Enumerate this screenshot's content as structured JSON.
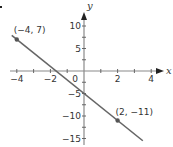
{
  "chart_data": {
    "type": "line",
    "title": "",
    "xlabel": "x",
    "ylabel": "y",
    "xlim": [
      -4.4,
      4.6
    ],
    "ylim": [
      -16,
      12
    ],
    "x_ticks": [
      -4,
      -3,
      -2,
      -1,
      0,
      1,
      2,
      3,
      4
    ],
    "x_tick_labels": [
      {
        "value": -4,
        "label": "−4"
      },
      {
        "value": -2,
        "label": "−2"
      },
      {
        "value": 0,
        "label": "0"
      },
      {
        "value": 2,
        "label": "2"
      },
      {
        "value": 4,
        "label": "4"
      }
    ],
    "y_ticks": [
      -15,
      -12.5,
      -10,
      -7.5,
      -5,
      -2.5,
      2.5,
      5,
      7.5,
      10
    ],
    "y_tick_labels": [
      {
        "value": 10,
        "label": "10"
      },
      {
        "value": 5,
        "label": "5"
      },
      {
        "value": -5,
        "label": "−5"
      },
      {
        "value": -10,
        "label": "−10"
      },
      {
        "value": -15,
        "label": "−15"
      }
    ],
    "grid": false,
    "series": [
      {
        "name": "line",
        "equation": "y = -3x - 5",
        "x": [
          -4.3,
          3.5
        ],
        "y": [
          7.9,
          -15.5
        ],
        "color": "#666666"
      }
    ],
    "points": [
      {
        "x": -4,
        "y": 7,
        "label": "(−4, 7)"
      },
      {
        "x": 2,
        "y": -11,
        "label": "(2, −11)"
      }
    ]
  },
  "colors": {
    "axis": "#8a8a8a",
    "line": "#666666",
    "text": "#333333"
  }
}
